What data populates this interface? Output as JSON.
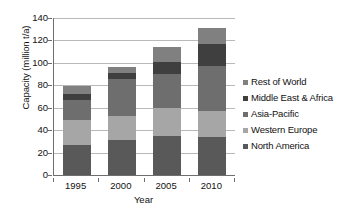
{
  "chart_data": {
    "type": "bar",
    "stacked": true,
    "title": "",
    "xlabel": "Year",
    "ylabel": "Capacity (million t/a)",
    "categories": [
      "1995",
      "2000",
      "2005",
      "2010"
    ],
    "ylim": [
      0,
      140
    ],
    "yticks": [
      0,
      20,
      40,
      60,
      80,
      100,
      120,
      140
    ],
    "ytick_labels": [
      "0",
      "20",
      "40",
      "60",
      "80",
      "100",
      "120",
      "140"
    ],
    "grid": true,
    "legend_position": "right",
    "series": [
      {
        "name": "North America",
        "color": "#595959",
        "values": [
          27,
          31,
          35,
          34
        ]
      },
      {
        "name": "Western Europe",
        "color": "#a6a6a6",
        "values": [
          22,
          22,
          25,
          23
        ]
      },
      {
        "name": "Asia-Pacific",
        "color": "#6e6e6e",
        "values": [
          18,
          33,
          30,
          40
        ]
      },
      {
        "name": "Middle East & Africa",
        "color": "#3f3f3f",
        "values": [
          5,
          5,
          11,
          20
        ]
      },
      {
        "name": "Rest of World",
        "color": "#808080",
        "values": [
          7,
          5,
          13,
          14
        ]
      }
    ],
    "totals": [
      79,
      96,
      114,
      131
    ]
  },
  "legend": {
    "items": [
      {
        "label": "Rest of World",
        "color": "#808080"
      },
      {
        "label": "Middle East & Africa",
        "color": "#3f3f3f"
      },
      {
        "label": "Asia-Pacific",
        "color": "#6e6e6e"
      },
      {
        "label": "Western Europe",
        "color": "#a6a6a6"
      },
      {
        "label": "North America",
        "color": "#595959"
      }
    ]
  },
  "axes": {
    "y_title": "Capacity (million t/a)",
    "x_title": "Year"
  },
  "style": {
    "axis_color": "#6e6e6e",
    "grid_color": "#b9b9b9",
    "text_color": "#111111",
    "background": "#ffffff"
  }
}
